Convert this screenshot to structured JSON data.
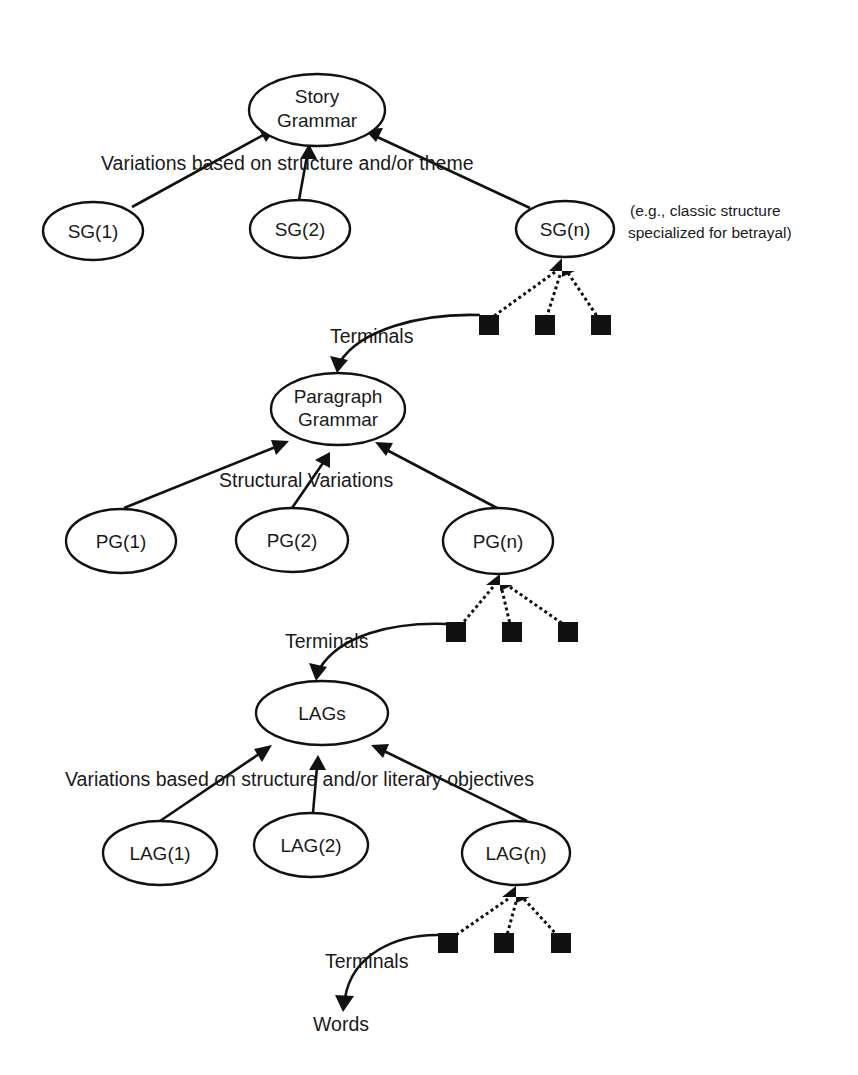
{
  "diagram": {
    "title": "",
    "levels": [
      {
        "id": "story",
        "root": {
          "lines": [
            "Story",
            "Grammar"
          ]
        },
        "edge_label": "Variations based on structure and/or theme",
        "children": [
          "SG(1)",
          "SG(2)",
          "SG(n)"
        ],
        "annotation": [
          "(e.g., classic structure",
          "specialized for betrayal)"
        ],
        "terminals_label": "Terminals",
        "terminal_count": 3
      },
      {
        "id": "paragraph",
        "root": {
          "lines": [
            "Paragraph",
            "Grammar"
          ]
        },
        "edge_label": "Structural Variations",
        "children": [
          "PG(1)",
          "PG(2)",
          "PG(n)"
        ],
        "terminals_label": "Terminals",
        "terminal_count": 3
      },
      {
        "id": "lags",
        "root": {
          "lines": [
            "LAGs"
          ]
        },
        "edge_label": "Variations based on structure and/or literary objectives",
        "children": [
          "LAG(1)",
          "LAG(2)",
          "LAG(n)"
        ],
        "terminals_label": "Terminals",
        "terminal_count": 3
      }
    ],
    "final_output": "Words",
    "colors": {
      "stroke": "#111111",
      "background": "#ffffff",
      "text": "#1a1a1a"
    }
  }
}
